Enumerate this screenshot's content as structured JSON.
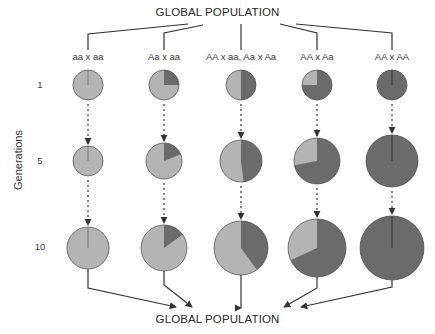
{
  "titles": {
    "top": "GLOBAL POPULATION",
    "bottom": "GLOBAL POPULATION"
  },
  "axis": {
    "label": "Generations"
  },
  "generations": [
    {
      "label": "1",
      "y": 85
    },
    {
      "label": "5",
      "y": 161
    },
    {
      "label": "10",
      "y": 248
    }
  ],
  "colors": {
    "light": "#b4b4b4",
    "dark": "#6b6b6b",
    "stroke": "#555555",
    "line": "#333333"
  },
  "crosses": [
    {
      "label": "aa x aa",
      "x": 88,
      "branch_from": [
        188,
        24
      ],
      "elbow_y": 34,
      "dark_fraction": [
        0.0,
        0.0,
        0.0
      ],
      "radius": [
        15,
        15,
        21
      ],
      "merge_to": [
        176,
        307
      ],
      "merge_elbow_y": 288
    },
    {
      "label": "Aa x aa",
      "x": 164,
      "branch_from": [
        203,
        25
      ],
      "elbow_y": 33,
      "dark_fraction": [
        0.25,
        0.19,
        0.15
      ],
      "radius": [
        15,
        18,
        23
      ],
      "merge_to": [
        192,
        307
      ],
      "merge_elbow_y": 285
    },
    {
      "label": "AA x aa, Aa x Aa",
      "x": 241,
      "branch_from": [
        241,
        24
      ],
      "elbow_y": 24,
      "dark_fraction": [
        0.5,
        0.48,
        0.4
      ],
      "radius": [
        15,
        21,
        27
      ],
      "merge_to": [
        241,
        308
      ],
      "merge_elbow_y": 308
    },
    {
      "label": "AA x Aa",
      "x": 317,
      "branch_from": [
        280,
        24
      ],
      "elbow_y": 33,
      "dark_fraction": [
        0.75,
        0.72,
        0.68
      ],
      "radius": [
        15,
        23,
        29
      ],
      "merge_to": [
        284,
        307
      ],
      "merge_elbow_y": 288
    },
    {
      "label": "AA x AA",
      "x": 392,
      "branch_from": [
        296,
        24
      ],
      "elbow_y": 33,
      "dark_fraction": [
        1.0,
        1.0,
        1.0
      ],
      "radius": [
        15,
        26,
        32
      ],
      "merge_to": [
        301,
        307
      ],
      "merge_elbow_y": 287
    }
  ],
  "chart_data": {
    "type": "pie-grid",
    "title": "GLOBAL POPULATION",
    "ylabel": "Generations",
    "rows": [
      "1",
      "5",
      "10"
    ],
    "columns": [
      "aa x aa",
      "Aa x aa",
      "AA x aa, Aa x Aa",
      "AA x Aa",
      "AA x AA"
    ],
    "series": [
      {
        "name": "A allele (dark)",
        "values": [
          [
            0,
            0.25,
            0.5,
            0.75,
            1.0
          ],
          [
            0,
            0.19,
            0.48,
            0.72,
            1.0
          ],
          [
            0,
            0.15,
            0.4,
            0.68,
            1.0
          ]
        ]
      },
      {
        "name": "a allele (light)",
        "values": [
          [
            1.0,
            0.75,
            0.5,
            0.25,
            0
          ],
          [
            1.0,
            0.81,
            0.52,
            0.28,
            0
          ],
          [
            1.0,
            0.85,
            0.6,
            0.32,
            0
          ]
        ]
      }
    ],
    "relative_size": [
      [
        15,
        15,
        15,
        15,
        15
      ],
      [
        15,
        18,
        21,
        23,
        26
      ],
      [
        21,
        23,
        27,
        29,
        32
      ]
    ]
  }
}
